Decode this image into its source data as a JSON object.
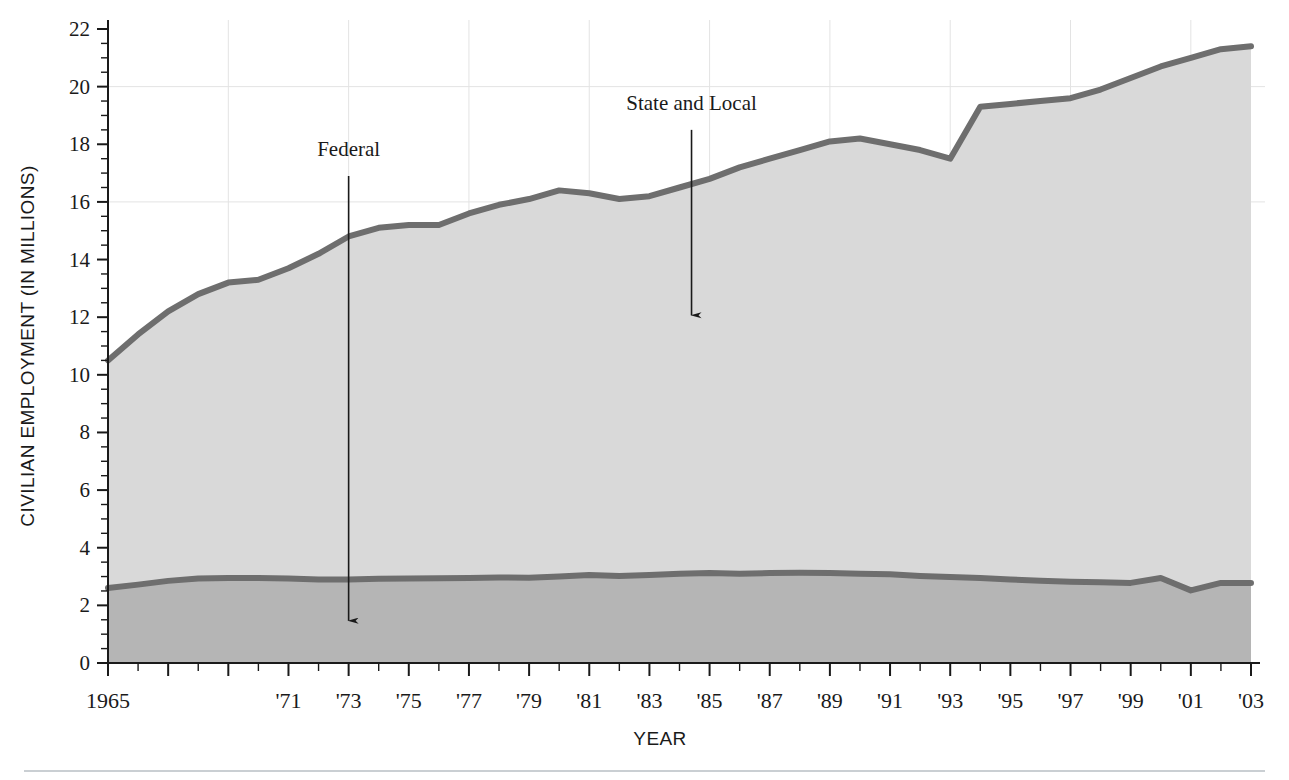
{
  "chart_data": {
    "type": "area",
    "title": "",
    "xlabel": "YEAR",
    "ylabel": "CIVILIAN EMPLOYMENT (IN MILLIONS)",
    "xlim": [
      1965,
      2003
    ],
    "ylim": [
      0,
      22
    ],
    "y_ticks": [
      0,
      2,
      4,
      6,
      8,
      10,
      12,
      14,
      16,
      18,
      20,
      22
    ],
    "y_tick_labels": [
      "0",
      "2",
      "4",
      "6",
      "8",
      "10",
      "12",
      "14",
      "16",
      "18",
      "20",
      "22"
    ],
    "y_minor_step": 0.5,
    "x_ticks": [
      1965,
      1967,
      1969,
      1971,
      1973,
      1975,
      1977,
      1979,
      1981,
      1983,
      1985,
      1987,
      1989,
      1991,
      1993,
      1995,
      1997,
      1999,
      2001,
      2003
    ],
    "x_tick_labels": [
      "1965",
      "",
      "",
      "'71",
      "'73",
      "'75",
      "'77",
      "'79",
      "'81",
      "'83",
      "'85",
      "'87",
      "'89",
      "'91",
      "'93",
      "'95",
      "'97",
      "'99",
      "'01",
      "'03"
    ],
    "x_minor_step": 1,
    "grid": {
      "vertical": true,
      "horizontal": true,
      "color": "#e3e3e3",
      "x_values": [
        1965,
        1969,
        1973,
        1977,
        1981,
        1985,
        1989,
        1993,
        1997,
        2001
      ],
      "y_values": [
        16,
        20
      ]
    },
    "x": [
      1965,
      1966,
      1967,
      1968,
      1969,
      1970,
      1971,
      1972,
      1973,
      1974,
      1975,
      1976,
      1977,
      1978,
      1979,
      1980,
      1981,
      1982,
      1983,
      1984,
      1985,
      1986,
      1987,
      1988,
      1989,
      1990,
      1991,
      1992,
      1993,
      1994,
      1995,
      1996,
      1997,
      1998,
      1999,
      2000,
      2001,
      2002,
      2003
    ],
    "series": [
      {
        "name": "State and Local",
        "stacked_total": true,
        "color": "#6e6e6e",
        "fill": "#d9d9d9",
        "values": [
          10.5,
          11.4,
          12.2,
          12.8,
          13.2,
          13.3,
          13.7,
          14.2,
          14.8,
          15.1,
          15.2,
          15.2,
          15.6,
          15.9,
          16.1,
          16.4,
          16.3,
          16.1,
          16.2,
          16.5,
          16.8,
          17.2,
          17.5,
          17.8,
          18.1,
          18.2,
          18.0,
          17.8,
          17.5,
          19.3,
          19.4,
          19.5,
          19.6,
          19.9,
          20.3,
          20.7,
          21.0,
          21.3,
          21.4
        ]
      },
      {
        "name": "Federal",
        "color": "#6e6e6e",
        "fill": "#b5b5b5",
        "values": [
          2.6,
          2.72,
          2.85,
          2.93,
          2.95,
          2.95,
          2.93,
          2.9,
          2.9,
          2.92,
          2.93,
          2.94,
          2.95,
          2.97,
          2.96,
          3.0,
          3.05,
          3.02,
          3.05,
          3.1,
          3.12,
          3.1,
          3.12,
          3.13,
          3.12,
          3.1,
          3.08,
          3.02,
          2.98,
          2.95,
          2.9,
          2.85,
          2.82,
          2.8,
          2.78,
          2.95,
          2.52,
          2.78,
          2.78
        ]
      }
    ],
    "annotations": [
      {
        "label": "Federal",
        "text_x": 1973,
        "text_y": 17.6,
        "arrow_from_y": 16.9,
        "arrow_to_y": 1.4
      },
      {
        "label": "State and Local",
        "text_x": 1984.4,
        "text_y": 19.2,
        "arrow_from_y": 18.5,
        "arrow_to_y": 12.0
      }
    ]
  },
  "footer": {
    "rule": true
  }
}
